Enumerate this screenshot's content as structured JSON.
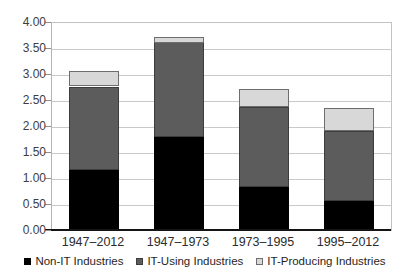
{
  "chart_data": {
    "type": "bar",
    "stacked": true,
    "title": "",
    "xlabel": "",
    "ylabel": "",
    "categories": [
      "1947–2012",
      "1947–1973",
      "1973–1995",
      "1995–2012"
    ],
    "series": [
      {
        "name": "Non-IT Industries",
        "color": "#000000",
        "border": "#000000",
        "values": [
          1.18,
          1.8,
          0.85,
          0.57
        ]
      },
      {
        "name": "IT-Using Industries",
        "color": "#5c5c5c",
        "border": "#3d3d3d",
        "values": [
          1.6,
          1.82,
          1.53,
          1.35
        ]
      },
      {
        "name": "IT-Producing Industries",
        "color": "#d8d8d8",
        "border": "#6e6e6e",
        "values": [
          0.28,
          0.12,
          0.34,
          0.44
        ]
      }
    ],
    "totals": [
      3.06,
      3.74,
      2.72,
      2.36
    ],
    "ylim": [
      0,
      4
    ],
    "ytick_step": 0.5,
    "yticks": [
      "0.00",
      "0.50",
      "1.00",
      "1.50",
      "2.00",
      "2.50",
      "3.00",
      "3.50",
      "4.00"
    ],
    "grid": true,
    "legend_position": "bottom"
  },
  "colors": {
    "background": "#ffffff",
    "gridline": "#c9c9c9",
    "plot_border": "#c3c3c3",
    "y_axis_line": "#b3b3b3",
    "x_axis_line": "#141414",
    "tick": "#8f8f8f"
  }
}
